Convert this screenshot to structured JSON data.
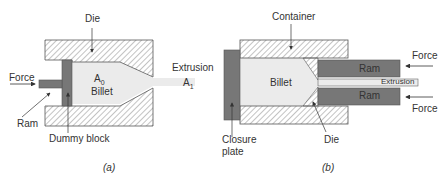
{
  "figure_a": {
    "caption": "(a)",
    "labels": {
      "die": "Die",
      "force": "Force",
      "ram": "Ram",
      "dummy_block": "Dummy block",
      "area_initial": "A",
      "area_initial_sub": "0",
      "billet": "Billet",
      "extrusion": "Extrusion",
      "area_final": "A",
      "area_final_sub": "1"
    }
  },
  "figure_b": {
    "caption": "(b)",
    "labels": {
      "container": "Container",
      "billet": "Billet",
      "ram_top": "Ram",
      "ram_bottom": "Ram",
      "extrusion": "Extrusion",
      "force_top": "Force",
      "force_bottom": "Force",
      "closure_plate_line1": "Closure",
      "closure_plate_line2": "plate",
      "die": "Die"
    }
  },
  "colors": {
    "hatch_line": "#777777",
    "billet_fill": "#ebebeb",
    "ram_fill": "#777777",
    "outline": "#555555",
    "text": "#333333"
  }
}
